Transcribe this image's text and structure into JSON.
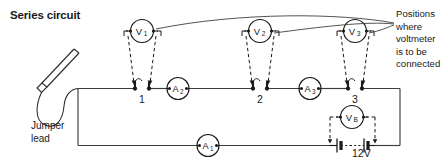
{
  "diagram": {
    "title": "Series circuit",
    "type": "electrical-circuit-schematic",
    "jumper_lead_label": "Jumper\nlead",
    "callout_text": "Positions\nwhere\nvoltmeter\nis to be\nconnected",
    "supply_label": "12V",
    "colors": {
      "ink": "#1a1a1a",
      "wire": "#3c3c3c",
      "background": "#ffffff"
    },
    "terminals": [
      {
        "id": "t1",
        "label": "1",
        "x": 142,
        "y": 88
      },
      {
        "id": "t2",
        "label": "2",
        "x": 260,
        "y": 88
      },
      {
        "id": "t3",
        "label": "3",
        "x": 355,
        "y": 88
      }
    ],
    "ammeters": [
      {
        "id": "a1",
        "label": "A",
        "sub": "1",
        "x": 208,
        "y": 145
      },
      {
        "id": "a2",
        "label": "A",
        "sub": "2",
        "x": 178,
        "y": 88
      },
      {
        "id": "a3",
        "label": "A",
        "sub": "3",
        "x": 310,
        "y": 88
      }
    ],
    "voltmeters": [
      {
        "id": "v1",
        "label": "V",
        "sub": "1",
        "x": 142,
        "y": 31,
        "connects_to": "t1"
      },
      {
        "id": "v2",
        "label": "V",
        "sub": "2",
        "x": 260,
        "y": 31,
        "connects_to": "t2"
      },
      {
        "id": "v3",
        "label": "V",
        "sub": "3",
        "x": 355,
        "y": 31,
        "connects_to": "t3"
      },
      {
        "id": "vb",
        "label": "V",
        "sub": "B",
        "x": 352,
        "y": 117,
        "connects_to": "battery"
      }
    ],
    "battery": {
      "label": "12V",
      "cells": 2,
      "x": 352,
      "y": 145
    }
  }
}
